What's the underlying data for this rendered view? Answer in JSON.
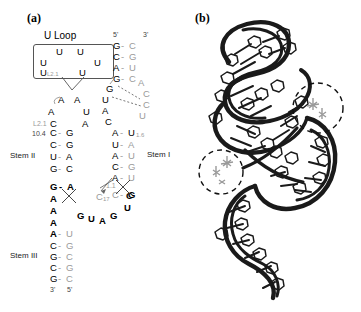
{
  "figure": {
    "panels": [
      {
        "id": "a",
        "label": "(a)",
        "type": "rna-secondary-structure"
      },
      {
        "id": "b",
        "label": "(b)",
        "type": "rna-tertiary-structure-ribbon"
      }
    ]
  },
  "panel_a": {
    "label": "(a)",
    "uloop": {
      "title": "U Loop",
      "bases": [
        "U",
        "U",
        "U",
        "U",
        "U",
        "U"
      ],
      "subscript": "L2.1"
    },
    "stem_labels": {
      "stem1": "Stem I",
      "stem2": "Stem II",
      "stem3": "Stem III"
    },
    "end_labels": {
      "stem1_five_prime": "5'",
      "stem1_three_prime": "3'",
      "stem3_three_prime": "3'",
      "stem3_five_prime": "5'"
    },
    "numeric_labels": {
      "loop2_1": "L2.1",
      "pos_10_4": "10.4",
      "pos_1_6": "1.6",
      "pos_1_1": "1.1",
      "pos_c17": "C",
      "pos_c17_sub": "17"
    },
    "stem1_pairs": [
      {
        "left": "G",
        "right": "C",
        "bond": "-"
      },
      {
        "left": "C",
        "right": "G",
        "bond": "-"
      },
      {
        "left": "A",
        "right": "U",
        "bond": "-"
      },
      {
        "left": "G",
        "right": "C",
        "bond": "-"
      },
      {
        "left": "A",
        "right": "U",
        "bond": "-"
      },
      {
        "left": "U",
        "right": "A",
        "bond": "-"
      },
      {
        "left": "A",
        "right": "U",
        "bond": "-"
      },
      {
        "left": "C",
        "right": "G",
        "bond": "-"
      },
      {
        "left": "A",
        "right": "U",
        "bond": "-"
      },
      {
        "left": "C",
        "right": "G",
        "bond": "-"
      }
    ],
    "stem1_loop_bases": [
      "A",
      "C",
      "C",
      "U"
    ],
    "stem1_left_bases": [
      "G",
      "U",
      "A",
      "C"
    ],
    "stem2_pairs": [
      {
        "left": "C",
        "right": "G",
        "bond": "-"
      },
      {
        "left": "C",
        "right": "G",
        "bond": "-"
      },
      {
        "left": "U",
        "right": "A",
        "bond": "-"
      },
      {
        "left": "G",
        "right": "C",
        "bond": "-"
      },
      {
        "left": "G",
        "right": "A",
        "bond": "-"
      }
    ],
    "stem2_loop_bases": [
      "A",
      "A",
      "A",
      "U",
      "C",
      "A"
    ],
    "stem3_pairs": [
      {
        "left": "A",
        "right": "U",
        "bond": "-"
      },
      {
        "left": "C",
        "right": "G",
        "bond": "-"
      },
      {
        "left": "G",
        "right": "C",
        "bond": "-"
      },
      {
        "left": "C",
        "right": "G",
        "bond": "-"
      },
      {
        "left": "G",
        "right": "C",
        "bond": "-"
      }
    ],
    "stem3_bulge_bases": [
      "A",
      "A",
      "A"
    ],
    "junction_bases": [
      "G",
      "U",
      "A",
      "G"
    ],
    "junction_right_bases": [
      "G",
      "U",
      "C"
    ]
  },
  "panel_b": {
    "label": "(b)",
    "description": "Three-dimensional ribbon model of the RNA with two dashed circles highlighting tertiary contact regions",
    "highlight_circles": 2,
    "colors": {
      "backbone": "#1a1a1a",
      "bases": "#2b2b2b",
      "highlight_outline": "#111111",
      "metal_cluster": "#9a9a9a"
    }
  },
  "colors": {
    "text": "#000000",
    "gray_base": "#9a9a9a",
    "box_border": "#555555",
    "background": "#ffffff"
  }
}
